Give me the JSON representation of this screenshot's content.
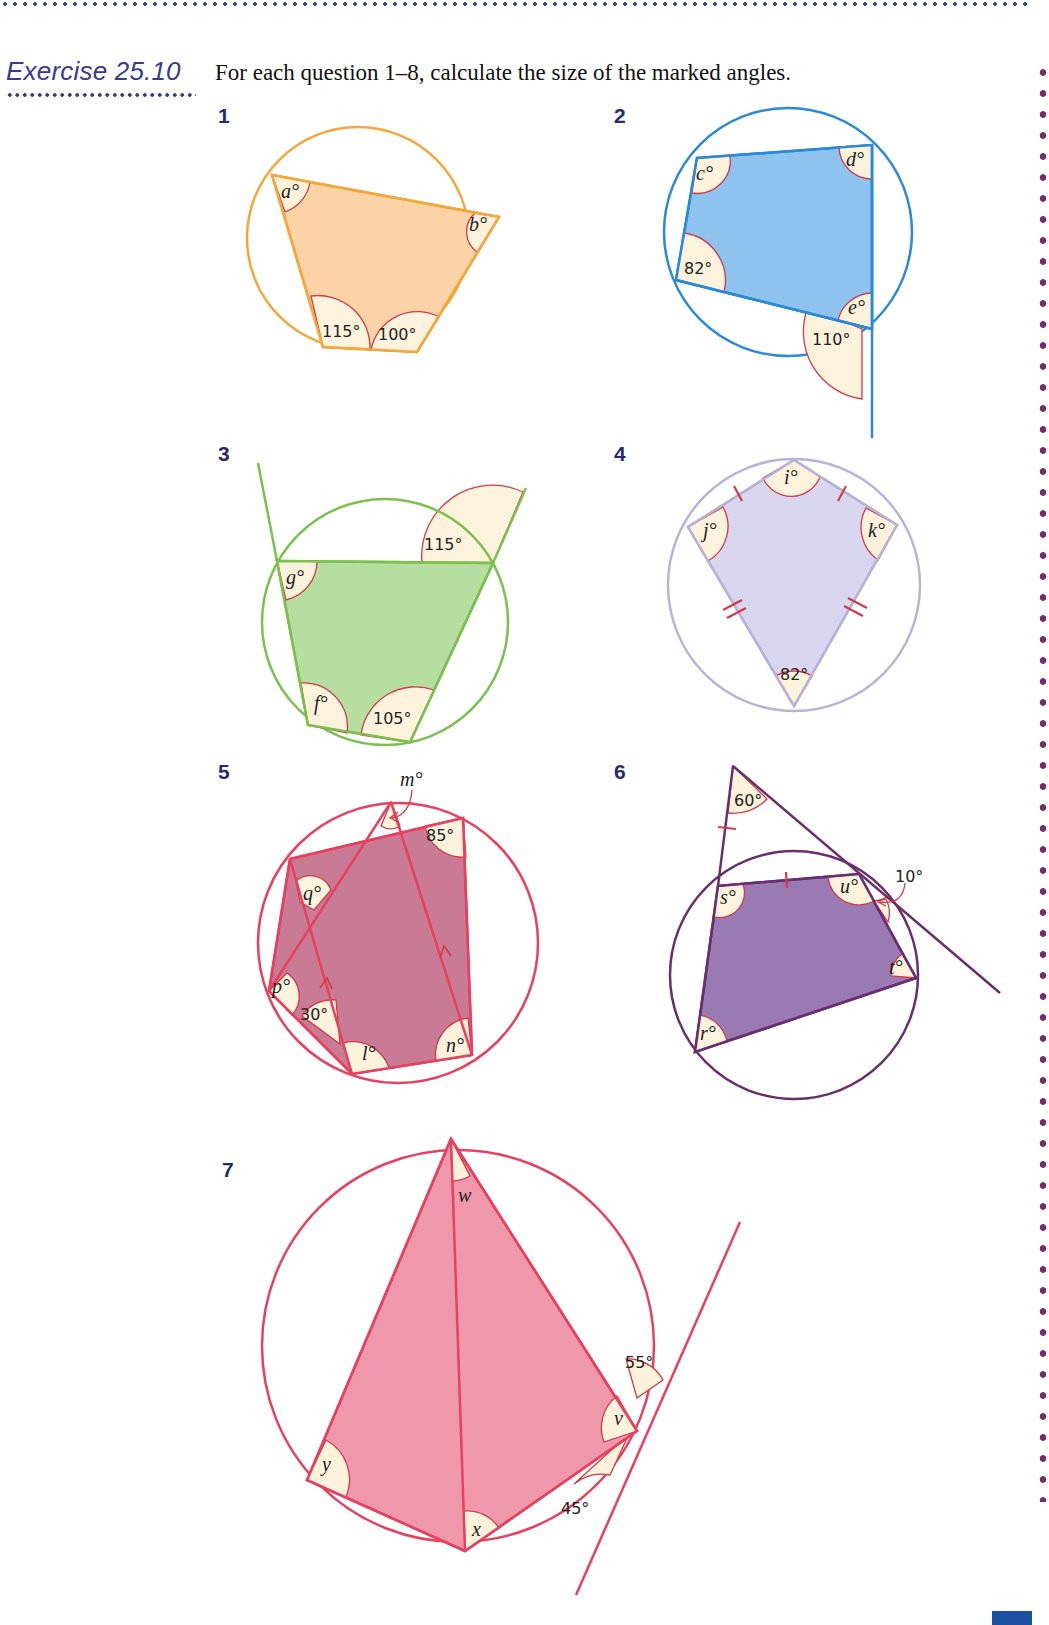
{
  "header": {
    "exercise_title": "Exercise 25.10",
    "instructions": "For each question 1–8, calculate the size of the marked angles."
  },
  "colors": {
    "title": "#3b3a8c",
    "question_number": "#2b2a6e",
    "angle_arc": "#d23a4a",
    "angle_fill": "#fdf3dc",
    "q1": "#f4a83a",
    "q2": "#2a8ad6",
    "q3": "#7cc04e",
    "q4": "#b8b3d8",
    "q5": "#e8405f",
    "q6": "#6a2e6e",
    "q7": "#e8405f"
  },
  "questions": [
    {
      "number": "1",
      "labels": {
        "a": "a°",
        "b": "b°",
        "g115": "115°",
        "g100": "100°"
      }
    },
    {
      "number": "2",
      "labels": {
        "c": "c°",
        "d": "d°",
        "g82": "82°",
        "e": "e°",
        "g110": "110°"
      }
    },
    {
      "number": "3",
      "labels": {
        "g": "g°",
        "f": "f°",
        "g115": "115°",
        "g105": "105°"
      }
    },
    {
      "number": "4",
      "labels": {
        "i": "i°",
        "j": "j°",
        "k": "k°",
        "g82": "82°"
      }
    },
    {
      "number": "5",
      "labels": {
        "m": "m°",
        "g85": "85°",
        "q": "q°",
        "p": "p°",
        "g30": "30°",
        "l": "l°",
        "n": "n°"
      }
    },
    {
      "number": "6",
      "labels": {
        "g60": "60°",
        "s": "s°",
        "u": "u°",
        "g10": "10°",
        "t": "t°",
        "r": "r°"
      }
    },
    {
      "number": "7",
      "labels": {
        "w": "w",
        "g55": "55°",
        "v": "v",
        "y": "y",
        "g45": "45°",
        "x": "x"
      }
    }
  ]
}
